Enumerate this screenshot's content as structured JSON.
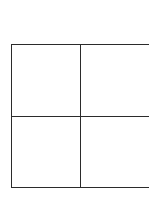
{
  "document": {
    "type": "scanned-page",
    "background_color": "#ffffff",
    "page_width": 149,
    "page_height": 198
  },
  "table": {
    "name": "empty-grid-table",
    "columns": 2,
    "rows": 2,
    "line_color": "#2b2b2b",
    "line_width_px": 1.6,
    "cell_background": "#ffffff",
    "right_edge_cropped": true,
    "geometry": {
      "left": 11,
      "top": 44,
      "bottom": 188,
      "vertical_divider_x": 80,
      "horizontal_divider_y": 116
    },
    "cells": [
      [
        "",
        ""
      ],
      [
        "",
        ""
      ]
    ]
  }
}
